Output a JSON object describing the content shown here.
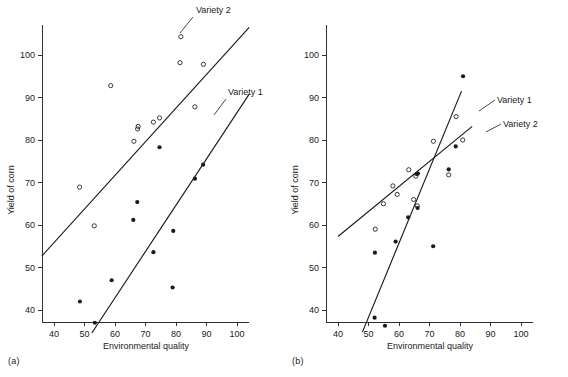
{
  "figure": {
    "panels": [
      {
        "caption": "(a)",
        "xlabel": "Environmental quality",
        "ylabel": "Yield of corn",
        "series_labels": [
          "Variety 2",
          "Variety 1"
        ]
      },
      {
        "caption": "(b)",
        "xlabel": "Environmental quality",
        "ylabel": "Yield of corn",
        "series_labels": [
          "Variety 1",
          "Variety 2"
        ]
      }
    ],
    "colors": {
      "ink": "#1a1a1a",
      "background": "#ffffff"
    }
  },
  "chart_data": [
    {
      "type": "scatter",
      "panel": "(a)",
      "title": "",
      "xlabel": "Environmental quality",
      "ylabel": "Yield of corn",
      "xlim": [
        32,
        104
      ],
      "ylim": [
        32,
        107
      ],
      "xticks": [
        40,
        50,
        60,
        70,
        80,
        90,
        100
      ],
      "yticks": [
        40,
        50,
        60,
        70,
        80,
        90,
        100
      ],
      "grid": false,
      "legend_position": "inline-annotations",
      "series": [
        {
          "name": "Variety 2",
          "marker": "open-circle",
          "points": [
            [
              48.4,
              68.9
            ],
            [
              53.2,
              59.8
            ],
            [
              58.6,
              92.8
            ],
            [
              66.2,
              79.7
            ],
            [
              67.4,
              82.6
            ],
            [
              67.6,
              83.2
            ],
            [
              72.6,
              84.2
            ],
            [
              74.6,
              85.2
            ],
            [
              81.3,
              98.2
            ],
            [
              81.6,
              104.3
            ],
            [
              86.2,
              87.8
            ],
            [
              89.0,
              97.8
            ]
          ],
          "fit_line": {
            "x": [
              36.0,
              104.0
            ],
            "y": [
              52.7,
              106.5
            ]
          }
        },
        {
          "name": "Variety 1",
          "marker": "filled-circle",
          "points": [
            [
              48.5,
              42.0
            ],
            [
              53.4,
              37.0
            ],
            [
              58.9,
              47.0
            ],
            [
              66.0,
              61.2
            ],
            [
              67.3,
              65.4
            ],
            [
              72.6,
              53.6
            ],
            [
              74.6,
              78.3
            ],
            [
              78.9,
              45.3
            ],
            [
              79.1,
              58.6
            ],
            [
              86.2,
              70.9
            ],
            [
              88.9,
              74.2
            ]
          ],
          "fit_line": {
            "x": [
              52.4,
              104.0
            ],
            "y": [
              34.6,
              90.8
            ]
          }
        }
      ]
    },
    {
      "type": "scatter",
      "panel": "(b)",
      "title": "",
      "xlabel": "Environmental quality",
      "ylabel": "Yield of corn",
      "xlim": [
        32,
        104
      ],
      "ylim": [
        32,
        107
      ],
      "xticks": [
        40,
        50,
        60,
        70,
        80,
        90,
        100
      ],
      "yticks": [
        40,
        50,
        60,
        70,
        80,
        90,
        100
      ],
      "grid": false,
      "legend_position": "inline-annotations",
      "series": [
        {
          "name": "Variety 1",
          "marker": "filled-circle",
          "points": [
            [
              52.0,
              38.2
            ],
            [
              52.1,
              53.5
            ],
            [
              55.4,
              36.3
            ],
            [
              58.9,
              56.1
            ],
            [
              63.0,
              61.8
            ],
            [
              65.8,
              72.0
            ],
            [
              66.2,
              72.1
            ],
            [
              66.1,
              64.0
            ],
            [
              71.2,
              55.0
            ],
            [
              76.3,
              73.1
            ],
            [
              78.6,
              78.5
            ],
            [
              81.0,
              95.0
            ]
          ],
          "fit_line": {
            "x": [
              48.0,
              80.5
            ],
            "y": [
              34.8,
              91.5
            ]
          }
        },
        {
          "name": "Variety 2",
          "marker": "open-circle",
          "points": [
            [
              52.2,
              59.0
            ],
            [
              54.9,
              65.0
            ],
            [
              58.0,
              69.2
            ],
            [
              59.4,
              67.2
            ],
            [
              63.2,
              73.0
            ],
            [
              64.8,
              66.0
            ],
            [
              65.5,
              71.5
            ],
            [
              66.0,
              64.5
            ],
            [
              71.3,
              79.7
            ],
            [
              76.3,
              71.8
            ],
            [
              78.7,
              85.5
            ],
            [
              80.9,
              80.0
            ]
          ],
          "fit_line": {
            "x": [
              40.0,
              84.0
            ],
            "y": [
              57.3,
              83.2
            ]
          }
        }
      ]
    }
  ]
}
